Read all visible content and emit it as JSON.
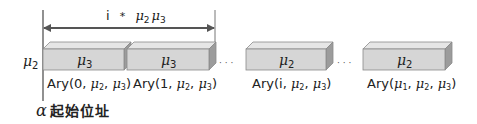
{
  "diagram": {
    "span_label": {
      "prefix": "i",
      "operator": "*",
      "terms": [
        "μ",
        "2",
        "μ",
        "3"
      ]
    },
    "row_label": {
      "symbol": "μ",
      "sub": "2"
    },
    "boxes": [
      {
        "inner_symbol": "μ",
        "inner_sub": "3",
        "label": {
          "name": "Ary",
          "args": [
            "0",
            "μ2",
            "μ3"
          ]
        }
      },
      {
        "inner_symbol": "μ",
        "inner_sub": "3",
        "label": {
          "name": "Ary",
          "args": [
            "1",
            "μ2",
            "μ3"
          ]
        }
      },
      {
        "inner_symbol": "μ",
        "inner_sub": "2",
        "label": {
          "name": "Ary",
          "args": [
            "i",
            "μ2",
            "μ3"
          ]
        }
      },
      {
        "inner_symbol": "μ",
        "inner_sub": "2",
        "label": {
          "name": "Ary",
          "args": [
            "μ1",
            "μ2",
            "μ3"
          ]
        }
      }
    ],
    "ellipsis": "· · ·",
    "base_address": {
      "symbol": "α",
      "text": "起始位址"
    },
    "colors": {
      "box_front": "#d6d6d6",
      "box_top": "#e6e6e6",
      "box_side": "#9c9c9c",
      "box_edge": "#8a8a8a",
      "line": "#555555",
      "text": "#222222"
    }
  }
}
